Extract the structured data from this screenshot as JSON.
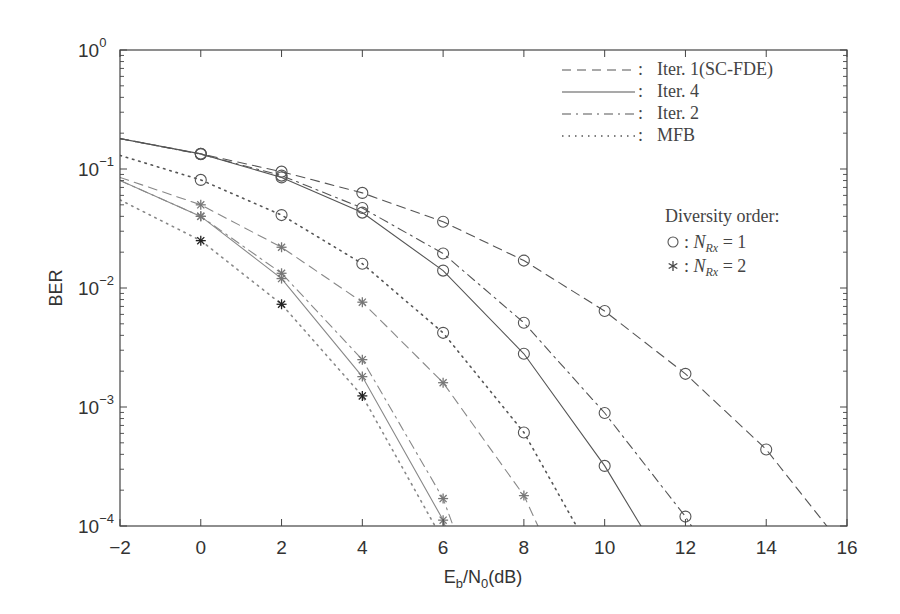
{
  "chart_data": {
    "type": "line",
    "title": "",
    "xlabel": "E_b/N_0(dB)",
    "xlabel_parts": {
      "main": "E",
      "sub1": "b",
      "mid": "/N",
      "sub2": "0",
      "tail": "(dB)"
    },
    "ylabel": "BER",
    "xlim": [
      -2,
      16
    ],
    "ylim": [
      0.0001,
      1
    ],
    "yscale": "log",
    "grid": false,
    "x_ticks": [
      -2,
      0,
      2,
      4,
      6,
      8,
      10,
      12,
      14,
      16
    ],
    "x_tick_labels": [
      "−2",
      "0",
      "2",
      "4",
      "6",
      "8",
      "10",
      "12",
      "14",
      "16"
    ],
    "y_ticks": [
      0,
      -1,
      -2,
      -3,
      -4
    ],
    "y_tick_labels": [
      {
        "base": "10",
        "exp": "0"
      },
      {
        "base": "10",
        "exp": "−1"
      },
      {
        "base": "10",
        "exp": "−2"
      },
      {
        "base": "10",
        "exp": "−3"
      },
      {
        "base": "10",
        "exp": "−4"
      }
    ],
    "legend": {
      "position": "upper right",
      "line_styles": [
        {
          "style": "dashed",
          "label": "Iter. 1(SC-FDE)"
        },
        {
          "style": "solid",
          "label": "Iter. 4"
        },
        {
          "style": "dashdot",
          "label": "Iter. 2"
        },
        {
          "style": "dotted",
          "label": "MFB"
        }
      ],
      "diversity_title": "Diversity order:",
      "markers": [
        {
          "marker": "circle",
          "label_var": "N",
          "label_sub": "Rx",
          "label_rest": " = 1"
        },
        {
          "marker": "asterisk",
          "label_var": "N",
          "label_sub": "Rx",
          "label_rest": " = 2"
        }
      ]
    },
    "series": [
      {
        "name": "Iter. 1 (SC-FDE), NRx=1",
        "style": "dashed",
        "marker": "circle",
        "x": [
          -2,
          0,
          2,
          4,
          6,
          8,
          10,
          12,
          14,
          15.5
        ],
        "y": [
          0.18,
          0.134,
          0.095,
          0.063,
          0.036,
          0.017,
          0.0064,
          0.0019,
          0.00044,
          0.0001
        ],
        "marker_x": [
          0,
          2,
          4,
          6,
          8,
          10,
          12,
          14
        ]
      },
      {
        "name": "Iter. 2, NRx=1",
        "style": "dashdot",
        "marker": "circle",
        "x": [
          -2,
          0,
          2,
          4,
          6,
          8,
          10,
          12,
          12.15
        ],
        "y": [
          0.18,
          0.133,
          0.088,
          0.047,
          0.0195,
          0.0051,
          0.00089,
          0.00012,
          0.0001
        ],
        "marker_x": [
          0,
          2,
          4,
          6,
          8,
          10,
          12
        ]
      },
      {
        "name": "Iter. 4, NRx=1",
        "style": "solid",
        "marker": "circle",
        "x": [
          -2,
          0,
          2,
          4,
          6,
          8,
          10,
          10.9
        ],
        "y": [
          0.18,
          0.134,
          0.085,
          0.043,
          0.014,
          0.0028,
          0.00032,
          0.0001
        ],
        "marker_x": [
          0,
          2,
          4,
          6,
          8,
          10
        ]
      },
      {
        "name": "MFB, NRx=1",
        "style": "dotted",
        "marker": "circle",
        "x": [
          -2,
          0,
          2,
          4,
          6,
          8,
          9.3
        ],
        "y": [
          0.13,
          0.081,
          0.041,
          0.016,
          0.0042,
          0.00061,
          0.0001
        ],
        "marker_x": [
          0,
          2,
          4,
          6,
          8
        ]
      },
      {
        "name": "Iter. 1 (SC-FDE), NRx=2",
        "style": "dashed",
        "marker": "asterisk",
        "x": [
          -2,
          0,
          2,
          4,
          6,
          8,
          8.35
        ],
        "y": [
          0.085,
          0.05,
          0.022,
          0.0076,
          0.0016,
          0.00018,
          0.0001
        ],
        "marker_x": [
          0,
          2,
          4,
          6,
          8
        ]
      },
      {
        "name": "Iter. 2, NRx=2",
        "style": "dashdot",
        "marker": "asterisk",
        "x": [
          -2,
          0,
          2,
          4,
          6,
          6.25
        ],
        "y": [
          0.08,
          0.04,
          0.0133,
          0.0025,
          0.00017,
          0.0001
        ],
        "marker_x": [
          0,
          2,
          4,
          6
        ]
      },
      {
        "name": "Iter. 4, NRx=2",
        "style": "solid",
        "marker": "asterisk",
        "x": [
          -2,
          0,
          2,
          4,
          6,
          6.05
        ],
        "y": [
          0.08,
          0.04,
          0.012,
          0.0018,
          0.000112,
          0.0001
        ],
        "marker_x": [
          0,
          2,
          4,
          6
        ]
      },
      {
        "name": "MFB, NRx=2",
        "style": "dotted",
        "marker": "asterisk",
        "x": [
          -2,
          0,
          2,
          4,
          5.8
        ],
        "y": [
          0.055,
          0.025,
          0.0073,
          0.00124,
          0.0001
        ],
        "marker_x": [
          0,
          2,
          4
        ]
      }
    ]
  },
  "plot_box": {
    "left": 120,
    "right": 847,
    "top": 50,
    "bottom": 526
  },
  "colors": {
    "axis": "#444444",
    "line_nrx1": "#555555",
    "line_nrx2": "#888888",
    "mfb_nrx2_marker": "#222222",
    "text": "#333333"
  }
}
